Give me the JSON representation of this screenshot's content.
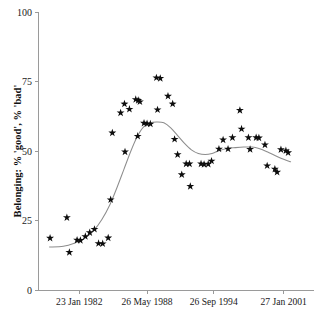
{
  "chart_data": {
    "type": "scatter",
    "title": "",
    "subtitle": "",
    "xlabel": "",
    "ylabel": "Belonging: % 'good', % 'bad'",
    "ylim": [
      0,
      100
    ],
    "yticks": [
      0,
      25,
      50,
      75,
      100
    ],
    "ytick_labels": [
      "0",
      "25",
      "50",
      "75",
      "100"
    ],
    "xtick_labels": [
      "23 Jan 1982",
      "26 May 1988",
      "26 Sep 1994",
      "27 Jan 2001"
    ],
    "xtick_positions_frac": [
      0.148,
      0.394,
      0.636,
      0.89
    ],
    "grid": false,
    "legend": "none",
    "marker": "star",
    "marker_color": "#0d0d0d",
    "line_color": "#8d8d8d",
    "axis_color": "#9a9a9a",
    "series": [
      {
        "name": "observations",
        "marker": "star",
        "points": [
          {
            "x": 0.042,
            "y": 18.8
          },
          {
            "x": 0.103,
            "y": 26.2
          },
          {
            "x": 0.112,
            "y": 13.7
          },
          {
            "x": 0.14,
            "y": 18.1
          },
          {
            "x": 0.152,
            "y": 18.0
          },
          {
            "x": 0.17,
            "y": 19.4
          },
          {
            "x": 0.186,
            "y": 20.8
          },
          {
            "x": 0.203,
            "y": 22.0
          },
          {
            "x": 0.218,
            "y": 16.9
          },
          {
            "x": 0.233,
            "y": 16.8
          },
          {
            "x": 0.253,
            "y": 18.9
          },
          {
            "x": 0.268,
            "y": 56.6
          },
          {
            "x": 0.262,
            "y": 32.6
          },
          {
            "x": 0.298,
            "y": 63.8
          },
          {
            "x": 0.312,
            "y": 67.0
          },
          {
            "x": 0.314,
            "y": 49.8
          },
          {
            "x": 0.33,
            "y": 65.1
          },
          {
            "x": 0.353,
            "y": 68.6
          },
          {
            "x": 0.362,
            "y": 68.3
          },
          {
            "x": 0.368,
            "y": 67.8
          },
          {
            "x": 0.36,
            "y": 55.4
          },
          {
            "x": 0.383,
            "y": 60.1
          },
          {
            "x": 0.394,
            "y": 59.9
          },
          {
            "x": 0.406,
            "y": 59.8
          },
          {
            "x": 0.428,
            "y": 76.4
          },
          {
            "x": 0.442,
            "y": 76.2
          },
          {
            "x": 0.432,
            "y": 64.9
          },
          {
            "x": 0.47,
            "y": 69.8
          },
          {
            "x": 0.487,
            "y": 67.0
          },
          {
            "x": 0.494,
            "y": 54.3
          },
          {
            "x": 0.505,
            "y": 48.8
          },
          {
            "x": 0.52,
            "y": 41.6
          },
          {
            "x": 0.536,
            "y": 45.5
          },
          {
            "x": 0.548,
            "y": 45.5
          },
          {
            "x": 0.551,
            "y": 37.4
          },
          {
            "x": 0.59,
            "y": 45.5
          },
          {
            "x": 0.601,
            "y": 45.3
          },
          {
            "x": 0.616,
            "y": 45.4
          },
          {
            "x": 0.628,
            "y": 46.5
          },
          {
            "x": 0.655,
            "y": 50.8
          },
          {
            "x": 0.67,
            "y": 54.1
          },
          {
            "x": 0.688,
            "y": 50.8
          },
          {
            "x": 0.704,
            "y": 54.9
          },
          {
            "x": 0.731,
            "y": 64.7
          },
          {
            "x": 0.737,
            "y": 58.0
          },
          {
            "x": 0.762,
            "y": 54.9
          },
          {
            "x": 0.768,
            "y": 50.7
          },
          {
            "x": 0.79,
            "y": 54.9
          },
          {
            "x": 0.8,
            "y": 54.8
          },
          {
            "x": 0.822,
            "y": 52.3
          },
          {
            "x": 0.83,
            "y": 44.8
          },
          {
            "x": 0.858,
            "y": 43.6
          },
          {
            "x": 0.866,
            "y": 42.5
          },
          {
            "x": 0.88,
            "y": 50.6
          },
          {
            "x": 0.898,
            "y": 50.2
          },
          {
            "x": 0.906,
            "y": 49.5
          }
        ]
      },
      {
        "name": "smoothed-trend",
        "marker": "none",
        "points": [
          {
            "x": 0.04,
            "y": 15.6
          },
          {
            "x": 0.09,
            "y": 15.9
          },
          {
            "x": 0.13,
            "y": 17.0
          },
          {
            "x": 0.165,
            "y": 18.6
          },
          {
            "x": 0.2,
            "y": 21.5
          },
          {
            "x": 0.23,
            "y": 25.5
          },
          {
            "x": 0.26,
            "y": 31.0
          },
          {
            "x": 0.285,
            "y": 37.0
          },
          {
            "x": 0.31,
            "y": 43.5
          },
          {
            "x": 0.335,
            "y": 50.0
          },
          {
            "x": 0.358,
            "y": 55.2
          },
          {
            "x": 0.38,
            "y": 58.6
          },
          {
            "x": 0.405,
            "y": 60.2
          },
          {
            "x": 0.43,
            "y": 60.5
          },
          {
            "x": 0.455,
            "y": 60.2
          },
          {
            "x": 0.48,
            "y": 58.4
          },
          {
            "x": 0.505,
            "y": 55.6
          },
          {
            "x": 0.53,
            "y": 52.8
          },
          {
            "x": 0.555,
            "y": 50.5
          },
          {
            "x": 0.58,
            "y": 49.2
          },
          {
            "x": 0.605,
            "y": 48.8
          },
          {
            "x": 0.63,
            "y": 49.2
          },
          {
            "x": 0.655,
            "y": 50.2
          },
          {
            "x": 0.685,
            "y": 51.0
          },
          {
            "x": 0.715,
            "y": 51.3
          },
          {
            "x": 0.745,
            "y": 51.5
          },
          {
            "x": 0.775,
            "y": 51.5
          },
          {
            "x": 0.8,
            "y": 51.0
          },
          {
            "x": 0.83,
            "y": 49.8
          },
          {
            "x": 0.86,
            "y": 48.4
          },
          {
            "x": 0.89,
            "y": 47.1
          },
          {
            "x": 0.915,
            "y": 46.2
          }
        ]
      }
    ]
  }
}
